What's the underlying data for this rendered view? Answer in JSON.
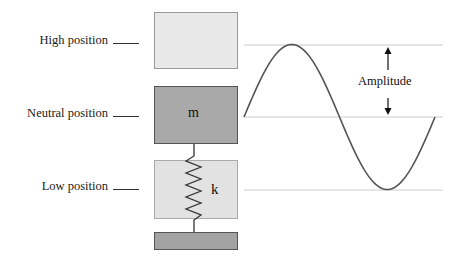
{
  "labels": {
    "high": "High position",
    "neutral": "Neutral position",
    "low": "Low position"
  },
  "mass_label": "m",
  "spring_label": "k",
  "amplitude_label": "Amplitude",
  "colors": {
    "high_box_fill": "#e8e8e8",
    "high_box_border": "#9a9a9a",
    "mass_fill": "#a9a9a9",
    "mass_border": "#555555",
    "low_box_fill": "#e2e2e2",
    "low_box_border": "#aaaaaa",
    "base_fill": "#a3a3a3",
    "base_border": "#555555",
    "wave": "#555555",
    "guide_line": "#cccccc"
  }
}
